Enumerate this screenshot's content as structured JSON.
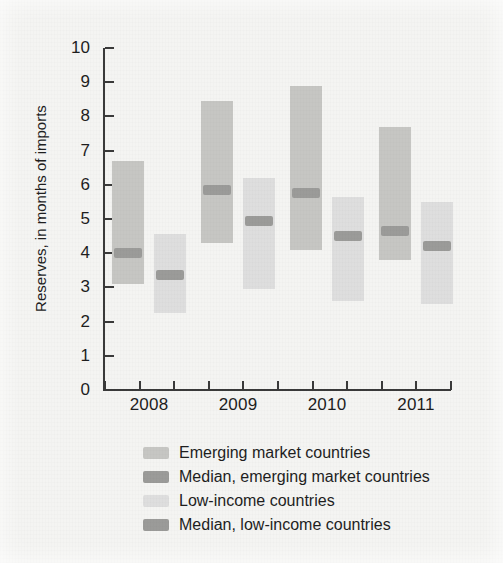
{
  "figure": {
    "background_color": "#f4f4f2",
    "axis_color": "#3a3a3a",
    "text_color": "#1e1e1e"
  },
  "chart_data": {
    "type": "bar",
    "subtype": "range-bars-with-median",
    "title": "",
    "xlabel": "",
    "ylabel": "Reserves, in months of imports",
    "categories": [
      "2008",
      "2009",
      "2010",
      "2011"
    ],
    "ylim": [
      0,
      10
    ],
    "yticks": [
      0,
      1,
      2,
      3,
      4,
      5,
      6,
      7,
      8,
      9,
      10
    ],
    "ytick_labels": [
      "0",
      "1",
      "2",
      "3",
      "4",
      "5",
      "6",
      "7",
      "8",
      "9",
      "10"
    ],
    "grid": false,
    "legend_position": "below-axis",
    "series": [
      {
        "name": "Emerging market countries",
        "color": "#c6c6c3",
        "kind": "range",
        "low": [
          3.1,
          4.3,
          4.1,
          3.8
        ],
        "high": [
          6.7,
          8.45,
          8.9,
          7.7
        ]
      },
      {
        "name": "Median, emerging market countries",
        "color": "#9b9b99",
        "kind": "median",
        "values": [
          4.0,
          5.85,
          5.75,
          4.65
        ]
      },
      {
        "name": "Low-income countries",
        "color": "#dedede",
        "kind": "range",
        "low": [
          2.25,
          2.95,
          2.6,
          2.5
        ],
        "high": [
          4.55,
          6.2,
          5.65,
          5.5
        ]
      },
      {
        "name": "Median, low-income countries",
        "color": "#9b9b99",
        "kind": "median",
        "values": [
          3.35,
          4.95,
          4.5,
          4.2
        ]
      }
    ]
  },
  "legend": {
    "items": [
      {
        "label": "Emerging market countries",
        "color": "#c6c6c3"
      },
      {
        "label": "Median, emerging market countries",
        "color": "#9b9b99"
      },
      {
        "label": "Low-income countries",
        "color": "#dedede"
      },
      {
        "label": "Median, low-income countries",
        "color": "#9b9b99"
      }
    ]
  }
}
